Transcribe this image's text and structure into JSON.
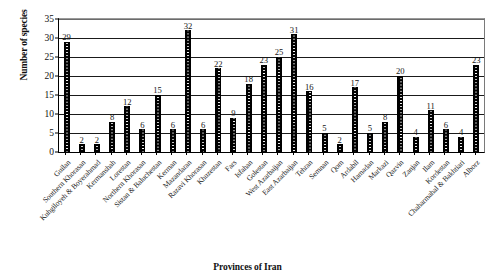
{
  "chart_data": {
    "type": "bar",
    "title": "",
    "xlabel": "Provinces of Iran",
    "ylabel": "Number of species",
    "ylim": [
      0,
      35
    ],
    "yticks": [
      0,
      5,
      10,
      15,
      20,
      25,
      30,
      35
    ],
    "grid": true,
    "legend": null,
    "bar_color": "#000000",
    "bar_pattern": "white-dotted-vertical",
    "categories": [
      "Guilan",
      "Southern Khorasan",
      "Kuhgiloyeh & Boyerahmad",
      "Kermanshah",
      "Lorestan",
      "Northern Khorasan",
      "Sistan & Baluchestan",
      "Kerman",
      "Mazandaran",
      "Razavi Khorasan",
      "Khuzestan",
      "Fars",
      "Isfahan",
      "Golestan",
      "West Azarbaijan",
      "East Azarbaijan",
      "Tehran",
      "Semnan",
      "Qom",
      "Ardabil",
      "Hamadan",
      "Markazi",
      "Qazvin",
      "Zanjan",
      "Ilam",
      "Kordestan",
      "Chaharmahal & Bakhtiari",
      "Alborz"
    ],
    "values": [
      29,
      2,
      2,
      8,
      12,
      6,
      15,
      6,
      32,
      6,
      22,
      9,
      18,
      23,
      25,
      31,
      16,
      5,
      2,
      17,
      5,
      8,
      20,
      4,
      11,
      6,
      4,
      23
    ],
    "data_labels": [
      "29",
      "2",
      "2",
      "8",
      "12",
      "6",
      "15",
      "6",
      "32",
      "6",
      "22",
      "9",
      "18",
      "23",
      "25",
      "31",
      "16",
      "5",
      "2",
      "17",
      "5",
      "8",
      "20",
      "4",
      "11",
      "6",
      "4",
      "23"
    ]
  }
}
